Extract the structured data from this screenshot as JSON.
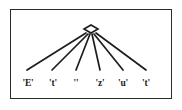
{
  "figure": {
    "type": "syntax-tree-diagram",
    "frame": {
      "visible": true,
      "border_color": "#2b2b2b",
      "background_color": "#ffffff",
      "x": 10,
      "y": 9,
      "width": 162,
      "height": 90
    },
    "ink_color": "#1d1d1d",
    "root": {
      "shape": "diamond",
      "label": "",
      "center_x": 91,
      "center_y": 29,
      "width": 14,
      "height": 8,
      "filled": false
    },
    "leaves": [
      {
        "label": "'E'",
        "x": 28,
        "y": 78
      },
      {
        "label": "'t'",
        "x": 53,
        "y": 78
      },
      {
        "label": "''",
        "x": 76,
        "y": 78
      },
      {
        "label": "'z'",
        "x": 100,
        "y": 78
      },
      {
        "label": "'u'",
        "x": 123,
        "y": 78
      },
      {
        "label": "'t'",
        "x": 146,
        "y": 78
      }
    ],
    "edges": [
      {
        "from": "root",
        "to": "'E'",
        "x1": 86,
        "y1": 33,
        "x2": 27,
        "y2": 70
      },
      {
        "from": "root",
        "to": "'t'",
        "x1": 88,
        "y1": 34,
        "x2": 52,
        "y2": 70
      },
      {
        "from": "root",
        "to": "''",
        "x1": 90,
        "y1": 34,
        "x2": 76,
        "y2": 70
      },
      {
        "from": "root",
        "to": "'z'",
        "x1": 92,
        "y1": 34,
        "x2": 100,
        "y2": 70
      },
      {
        "from": "root",
        "to": "'u'",
        "x1": 94,
        "y1": 34,
        "x2": 123,
        "y2": 70
      },
      {
        "from": "root",
        "to": "'t'2",
        "x1": 96,
        "y1": 33,
        "x2": 146,
        "y2": 70
      }
    ],
    "edge_stroke_width": 1.7
  }
}
